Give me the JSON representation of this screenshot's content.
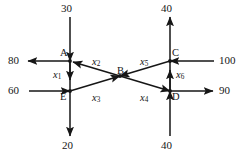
{
  "diagram": {
    "line_color": "#161616",
    "text_color": "#161616",
    "nodes": [
      {
        "id": "A",
        "label": "A",
        "x": 70,
        "y": 61
      },
      {
        "id": "B",
        "label": "B",
        "x": 120,
        "y": 76
      },
      {
        "id": "C",
        "label": "C",
        "x": 170,
        "y": 61
      },
      {
        "id": "D",
        "label": "D",
        "x": 170,
        "y": 91
      },
      {
        "id": "E",
        "label": "E",
        "x": 70,
        "y": 91
      }
    ],
    "external_flows": [
      {
        "name": "inflow-top-left",
        "value": "30",
        "direction": "down",
        "at_node": "A"
      },
      {
        "name": "inflow-top-right",
        "value": "40",
        "direction": "up",
        "at_node": "C"
      },
      {
        "name": "outflow-left-upper",
        "value": "80",
        "direction": "left",
        "at_node": "A"
      },
      {
        "name": "inflow-left-lower",
        "value": "60",
        "direction": "right",
        "at_node": "E"
      },
      {
        "name": "inflow-right-upper",
        "value": "100",
        "direction": "left",
        "at_node": "C"
      },
      {
        "name": "outflow-right-lower",
        "value": "90",
        "direction": "right",
        "at_node": "D"
      },
      {
        "name": "outflow-bottom-left",
        "value": "20",
        "direction": "down",
        "at_node": "E"
      },
      {
        "name": "inflow-bottom-right",
        "value": "40",
        "direction": "up",
        "at_node": "D"
      }
    ],
    "edges": [
      {
        "id": "x1",
        "label": "x",
        "sub": "1",
        "from": "A",
        "to": "E",
        "label_x": 55,
        "label_y": 72
      },
      {
        "id": "x2",
        "label": "x",
        "sub": "2",
        "from": "B",
        "to": "A",
        "label_x": 93,
        "label_y": 60
      },
      {
        "id": "x3",
        "label": "x",
        "sub": "3",
        "from": "E",
        "to": "B",
        "label_x": 93,
        "label_y": 94
      },
      {
        "id": "x4",
        "label": "x",
        "sub": "4",
        "from": "B",
        "to": "D",
        "label_x": 141,
        "label_y": 94
      },
      {
        "id": "x5",
        "label": "x",
        "sub": "5",
        "from": "C",
        "to": "B",
        "label_x": 141,
        "label_y": 60
      },
      {
        "id": "x6",
        "label": "x",
        "sub": "6",
        "from": "D",
        "to": "C",
        "label_x": 176,
        "label_y": 73
      }
    ]
  }
}
